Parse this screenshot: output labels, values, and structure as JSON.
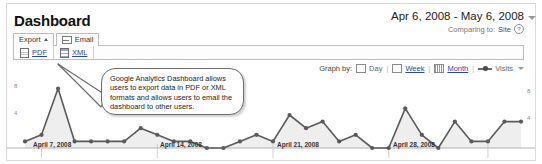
{
  "header": {
    "title": "Dashboard",
    "date_range": "Apr 6, 2008 - May 6, 2008",
    "comparing_label": "Comparing to:",
    "comparing_value": "Site",
    "help_glyph": "?",
    "range_caret_icon": "chevron-down-icon"
  },
  "toolbar": {
    "export_label": "Export",
    "export_caret_icon": "caret-up-icon",
    "email_label": "Email",
    "email_icon": "envelope-icon",
    "formats": [
      {
        "label": "PDF",
        "icon": "pdf-document-icon"
      },
      {
        "label": "XML",
        "icon": "xml-document-icon"
      }
    ]
  },
  "graph_by": {
    "label": "Graph by:",
    "separator": "|",
    "options": [
      {
        "label": "Day",
        "icon": "calendar-day-icon",
        "selected": false
      },
      {
        "label": "Week",
        "icon": "calendar-week-icon",
        "selected": false
      },
      {
        "label": "Month",
        "icon": "calendar-month-icon",
        "selected": false
      }
    ],
    "series_label": "Visits",
    "series_icon": "line-marker-icon",
    "series_caret_icon": "chevron-down-icon"
  },
  "callout": {
    "text": "Google Analytics Dashboard allows users to export data in PDF or XML formats and allows users to email the dashboard to other users."
  },
  "chart_data": {
    "type": "line",
    "title": "Visits",
    "xlabel": "",
    "ylabel": "Visits",
    "ylim": [
      0,
      10
    ],
    "yticks": [
      4,
      8
    ],
    "grid": false,
    "legend": "Visits",
    "legend_position": "top-right",
    "x_tick_labels": [
      {
        "label": "April 7, 2008",
        "index": 1
      },
      {
        "label": "April 14, 2008",
        "index": 8
      },
      {
        "label": "April 21, 2008",
        "index": 15
      },
      {
        "label": "April 28, 2008",
        "index": 22
      }
    ],
    "x": [
      "Apr 6, 2008",
      "Apr 7, 2008",
      "Apr 8, 2008",
      "Apr 9, 2008",
      "Apr 10, 2008",
      "Apr 11, 2008",
      "Apr 12, 2008",
      "Apr 13, 2008",
      "Apr 14, 2008",
      "Apr 15, 2008",
      "Apr 16, 2008",
      "Apr 17, 2008",
      "Apr 18, 2008",
      "Apr 19, 2008",
      "Apr 20, 2008",
      "Apr 21, 2008",
      "Apr 22, 2008",
      "Apr 23, 2008",
      "Apr 24, 2008",
      "Apr 25, 2008",
      "Apr 26, 2008",
      "Apr 27, 2008",
      "Apr 28, 2008",
      "Apr 29, 2008",
      "Apr 30, 2008",
      "May 1, 2008",
      "May 2, 2008",
      "May 3, 2008",
      "May 4, 2008",
      "May 5, 2008",
      "May 6, 2008"
    ],
    "series": [
      {
        "name": "Visits",
        "color": "#5a5a5a",
        "values": [
          1,
          2,
          9,
          1,
          1,
          1,
          1,
          3,
          2,
          1,
          1,
          0,
          0,
          1,
          2,
          1,
          5,
          3,
          4,
          1,
          2,
          0,
          0,
          6,
          2,
          0,
          4,
          1,
          1,
          4,
          4
        ]
      }
    ]
  }
}
